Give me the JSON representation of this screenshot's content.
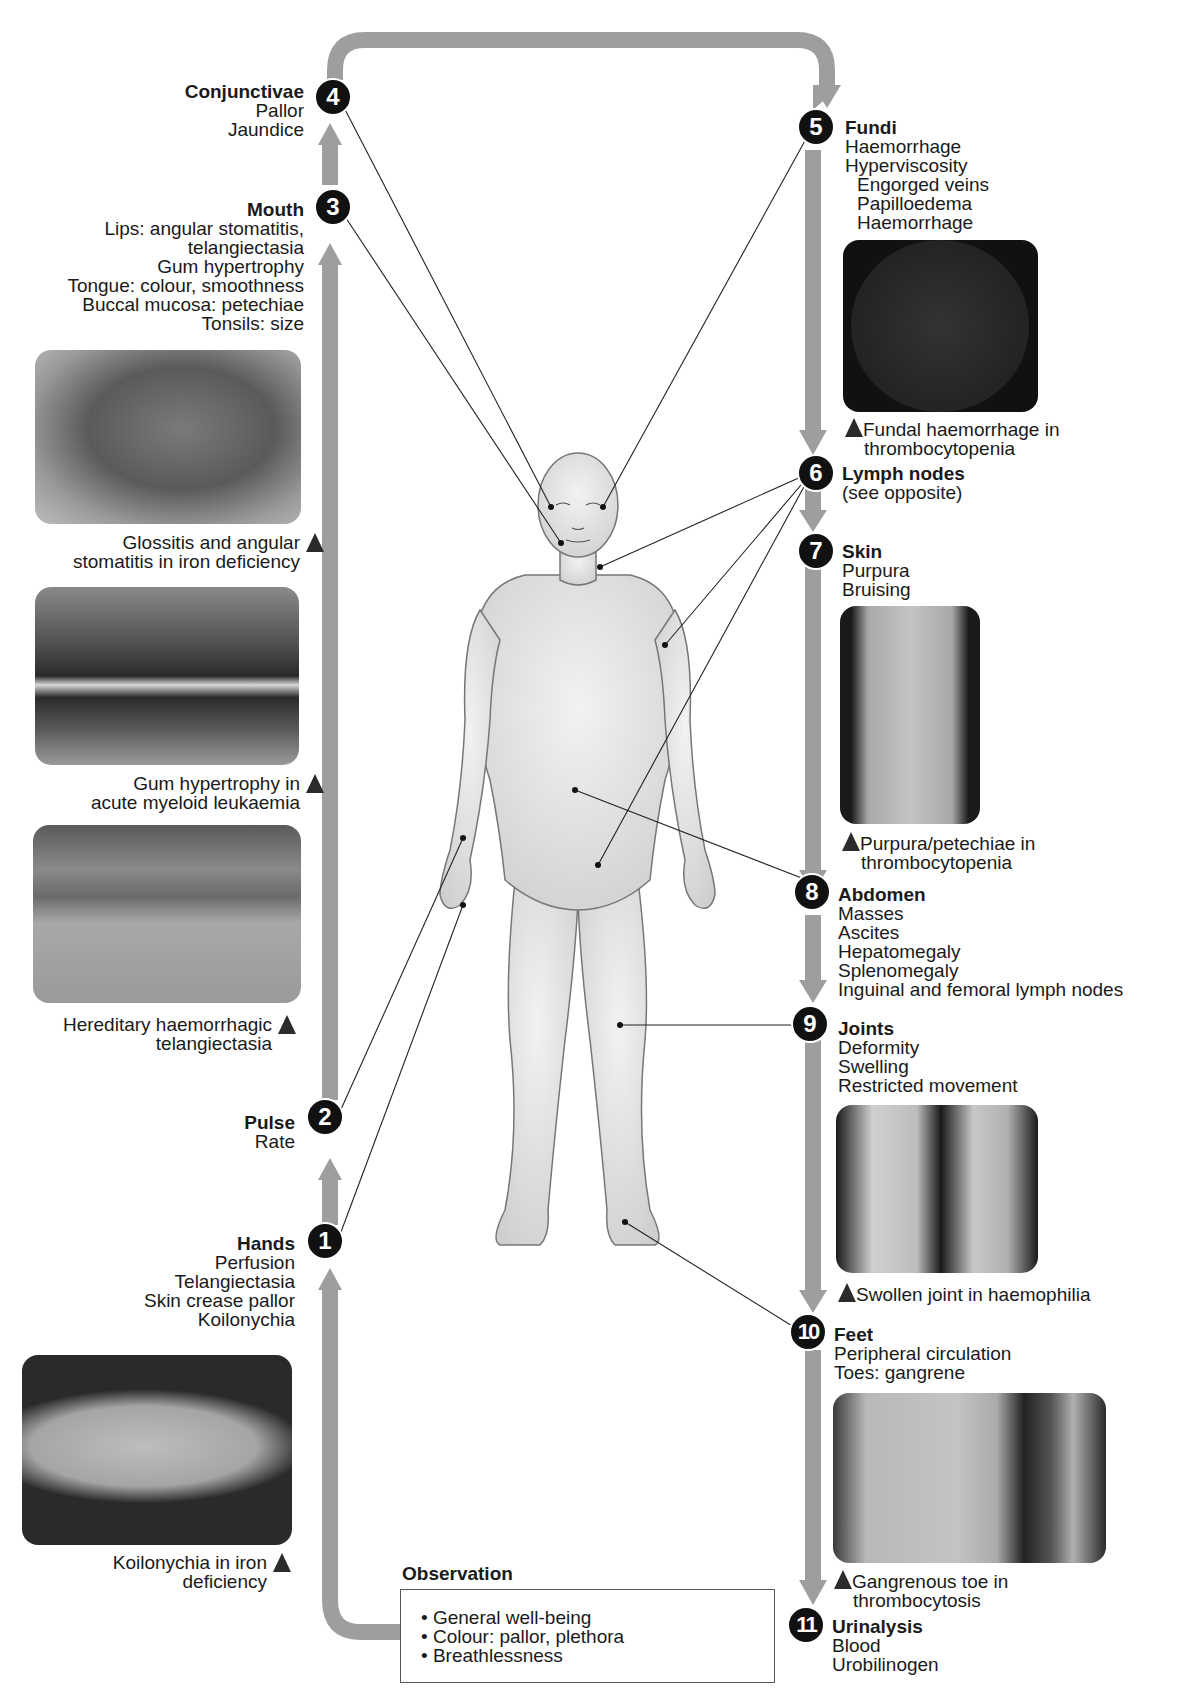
{
  "diagram": {
    "type": "clinical-examination-flow",
    "arrow_color": "#9e9e9e",
    "badge_color": "#111111"
  },
  "left_sections": [
    {
      "number": "4",
      "title": "Conjunctivae",
      "items": [
        "Pallor",
        "Jaundice"
      ]
    },
    {
      "number": "3",
      "title": "Mouth",
      "items": [
        "Lips: angular stomatitis,",
        "telangiectasia",
        "Gum hypertrophy",
        "Tongue: colour, smoothness",
        "Buccal mucosa: petechiae",
        "Tonsils: size"
      ]
    },
    {
      "number": "2",
      "title": "Pulse",
      "items": [
        "Rate"
      ]
    },
    {
      "number": "1",
      "title": "Hands",
      "items": [
        "Perfusion",
        "Telangiectasia",
        "Skin crease pallor",
        "Koilonychia"
      ]
    }
  ],
  "right_sections": [
    {
      "number": "5",
      "title": "Fundi",
      "items": [
        "Haemorrhage",
        "Hyperviscosity"
      ],
      "sub_items": [
        "Engorged veins",
        "Papilloedema",
        "Haemorrhage"
      ]
    },
    {
      "number": "6",
      "title": "Lymph nodes",
      "items": [
        "(see opposite)"
      ]
    },
    {
      "number": "7",
      "title": "Skin",
      "items": [
        "Purpura",
        "Bruising"
      ]
    },
    {
      "number": "8",
      "title": "Abdomen",
      "items": [
        "Masses",
        "Ascites",
        "Hepatomegaly",
        "Splenomegaly",
        "Inguinal and femoral lymph nodes"
      ]
    },
    {
      "number": "9",
      "title": "Joints",
      "items": [
        "Deformity",
        "Swelling",
        "Restricted movement"
      ]
    },
    {
      "number": "10",
      "title": "Feet",
      "items": [
        "Peripheral circulation",
        "Toes: gangrene"
      ]
    },
    {
      "number": "11",
      "title": "Urinalysis",
      "items": [
        "Blood",
        "Urobilinogen"
      ]
    }
  ],
  "photos": {
    "tongue": {
      "caption": [
        "Glossitis and angular",
        "stomatitis in iron deficiency"
      ]
    },
    "gums": {
      "caption": [
        "Gum hypertrophy in",
        "acute myeloid leukaemia"
      ]
    },
    "lips": {
      "caption": [
        "Hereditary haemorrhagic",
        "telangiectasia"
      ]
    },
    "finger": {
      "caption": [
        "Koilonychia in iron",
        "deficiency"
      ]
    },
    "fundus": {
      "caption": [
        "Fundal haemorrhage in",
        "thrombocytopenia"
      ]
    },
    "leg": {
      "caption": [
        "Purpura/petechiae in",
        "thrombocytopenia"
      ]
    },
    "knees": {
      "caption": [
        "Swollen joint in haemophilia"
      ]
    },
    "toes": {
      "caption": [
        "Gangrenous toe in",
        "thrombocytosis"
      ]
    }
  },
  "observation": {
    "title": "Observation",
    "items": [
      "General well-being",
      "Colour: pallor, plethora",
      "Breathlessness"
    ]
  }
}
